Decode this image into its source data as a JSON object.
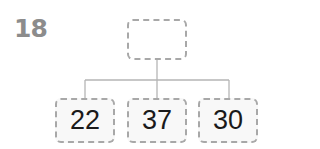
{
  "problem": {
    "number": "18"
  },
  "tree": {
    "root": {
      "value": ""
    },
    "children": [
      {
        "value": "22"
      },
      {
        "value": "37"
      },
      {
        "value": "30"
      }
    ]
  },
  "colors": {
    "number_text": "#8c8c8c",
    "box_border": "#a8a8a8",
    "connector": "#b5b5b5",
    "value_text": "#1a1a1a"
  }
}
